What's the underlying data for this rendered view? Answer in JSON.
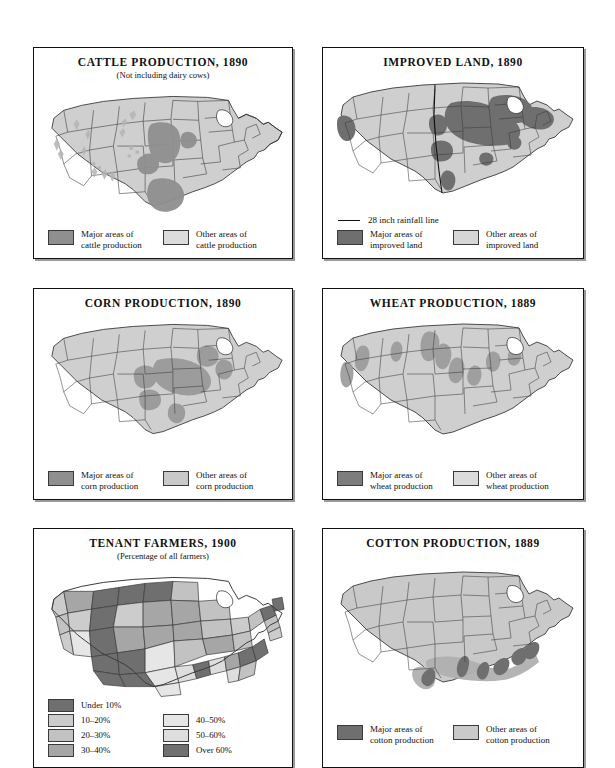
{
  "page": {
    "background": "#ffffff",
    "kind": "historical atlas page, six US thematic maps"
  },
  "palette": {
    "major": "#8f8f8f",
    "other": "#cfcfcf",
    "state_fill": "#c9c9c9",
    "outline": "#3a3a3a",
    "border": "#111111",
    "t_under10": "#6f6f6f",
    "t_10_20": "#cccccc",
    "t_20_30": "#c2c2c2",
    "t_30_40": "#a6a6a6",
    "t_40_50": "#e6e6e6",
    "t_50_60": "#dedede",
    "t_over60": "#707070"
  },
  "panels": [
    {
      "id": "cattle-production",
      "title": "CATTLE PRODUCTION, 1890",
      "subtitle": "(Not including dairy cows)",
      "legend": [
        {
          "label_line1": "Major areas of",
          "label_line2": "cattle production",
          "color": "#8f8f8f"
        },
        {
          "label_line1": "Other areas of",
          "label_line2": "cattle production",
          "color": "#dcdcdc"
        }
      ]
    },
    {
      "id": "improved-land",
      "title": "IMPROVED LAND, 1890",
      "subtitle": "",
      "rainfall_label": "28 inch rainfall line",
      "legend": [
        {
          "label_line1": "Major areas of",
          "label_line2": "improved land",
          "color": "#6f6f6f"
        },
        {
          "label_line1": "Other areas of",
          "label_line2": "improved land",
          "color": "#d6d6d6"
        }
      ]
    },
    {
      "id": "corn-production",
      "title": "CORN PRODUCTION, 1890",
      "subtitle": "",
      "legend": [
        {
          "label_line1": "Major areas of",
          "label_line2": "corn production",
          "color": "#8f8f8f"
        },
        {
          "label_line1": "Other areas of",
          "label_line2": "corn production",
          "color": "#c9c9c9"
        }
      ]
    },
    {
      "id": "wheat-production",
      "title": "WHEAT PRODUCTION, 1889",
      "subtitle": "",
      "legend": [
        {
          "label_line1": "Major areas of",
          "label_line2": "wheat production",
          "color": "#7d7d7d"
        },
        {
          "label_line1": "Other areas of",
          "label_line2": "wheat production",
          "color": "#dcdcdc"
        }
      ]
    },
    {
      "id": "tenant-farmers",
      "title": "TENANT FARMERS, 1900",
      "subtitle": "(Percentage of all farmers)",
      "legend": [
        {
          "label": "Under 10%",
          "color": "#6f6f6f"
        },
        {
          "label": "10–20%",
          "color": "#cccccc"
        },
        {
          "label": "20–30%",
          "color": "#c2c2c2"
        },
        {
          "label": "30–40%",
          "color": "#a6a6a6"
        },
        {
          "label": "40–50%",
          "color": "#e6e6e6"
        },
        {
          "label": "50–60%",
          "color": "#dedede"
        },
        {
          "label": "Over 60%",
          "color": "#707070"
        }
      ]
    },
    {
      "id": "cotton-production",
      "title": "COTTON PRODUCTION, 1889",
      "subtitle": "",
      "legend": [
        {
          "label_line1": "Major areas of",
          "label_line2": "cotton production",
          "color": "#6f6f6f"
        },
        {
          "label_line1": "Other areas of",
          "label_line2": "cotton production",
          "color": "#c9c9c9"
        }
      ]
    }
  ]
}
